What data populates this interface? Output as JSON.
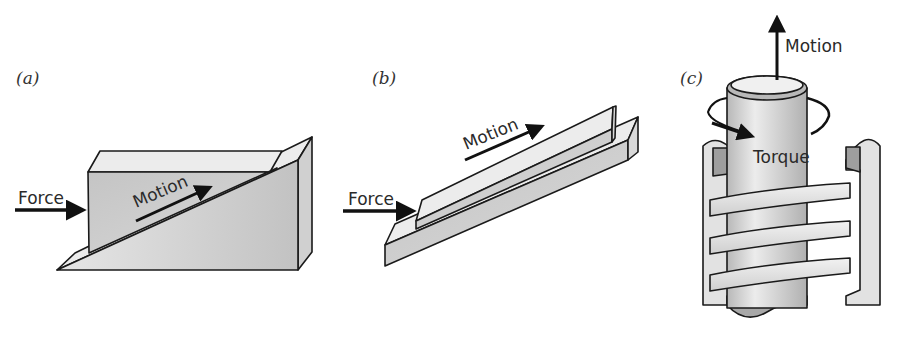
{
  "figure": {
    "panels": [
      {
        "id": "a",
        "label": "(a)",
        "description": "Block on an inclined wedge",
        "force_label": "Force",
        "motion_label": "Motion"
      },
      {
        "id": "b",
        "label": "(b)",
        "description": "Slider on an inclined rail",
        "force_label": "Force",
        "motion_label": "Motion"
      },
      {
        "id": "c",
        "label": "(c)",
        "description": "Screw in a threaded housing",
        "motion_label": "Motion",
        "torque_label": "Torque"
      }
    ],
    "colors": {
      "face_dark": "#bdbdbd",
      "face_mid": "#d6d6d6",
      "face_light": "#ececec",
      "outline": "#1a1a1a",
      "arrow": "#111111"
    }
  }
}
